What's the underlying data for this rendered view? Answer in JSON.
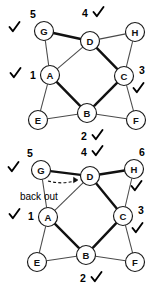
{
  "figure": {
    "colors": {
      "node_fill": "#ffffff",
      "node_stroke": "#1a1a1a",
      "edge_thin": "#4a4a4a",
      "edge_bold": "#111111",
      "text": "#000000"
    }
  },
  "graphs": [
    {
      "id": "graph-top",
      "nodes": [
        {
          "id": "G",
          "label": "G",
          "cx": 44,
          "cy": 31,
          "r": 9.5
        },
        {
          "id": "D",
          "label": "D",
          "cx": 90,
          "cy": 41,
          "r": 9.5
        },
        {
          "id": "H",
          "label": "H",
          "cx": 135,
          "cy": 32,
          "r": 9.5
        },
        {
          "id": "A",
          "label": "A",
          "cx": 50,
          "cy": 75,
          "r": 9.5
        },
        {
          "id": "C",
          "label": "C",
          "cx": 124,
          "cy": 76,
          "r": 9.5
        },
        {
          "id": "E",
          "label": "E",
          "cx": 38,
          "cy": 120,
          "r": 9.5
        },
        {
          "id": "B",
          "label": "B",
          "cx": 87,
          "cy": 113,
          "r": 9.5
        },
        {
          "id": "F",
          "label": "F",
          "cx": 136,
          "cy": 120,
          "r": 9.5
        }
      ],
      "edges": [
        {
          "from": "G",
          "to": "D",
          "style": "bold"
        },
        {
          "from": "D",
          "to": "H",
          "style": "thin"
        },
        {
          "from": "G",
          "to": "A",
          "style": "thin"
        },
        {
          "from": "A",
          "to": "D",
          "style": "thin"
        },
        {
          "from": "D",
          "to": "C",
          "style": "bold"
        },
        {
          "from": "C",
          "to": "H",
          "style": "thin"
        },
        {
          "from": "A",
          "to": "E",
          "style": "thin"
        },
        {
          "from": "A",
          "to": "B",
          "style": "bold"
        },
        {
          "from": "B",
          "to": "C",
          "style": "bold"
        },
        {
          "from": "E",
          "to": "B",
          "style": "thin"
        },
        {
          "from": "B",
          "to": "F",
          "style": "thin"
        },
        {
          "from": "C",
          "to": "F",
          "style": "thin"
        }
      ],
      "order_labels": [
        {
          "text": "5",
          "x": 33,
          "y": 14
        },
        {
          "text": "4",
          "x": 85,
          "y": 13
        },
        {
          "text": "1",
          "x": 33,
          "y": 75
        },
        {
          "text": "3",
          "x": 142,
          "y": 70
        },
        {
          "text": "2",
          "x": 84,
          "y": 136
        }
      ],
      "check_marks": [
        {
          "x": 14,
          "y": 27
        },
        {
          "x": 98,
          "y": 12
        },
        {
          "x": 15,
          "y": 73
        },
        {
          "x": 138,
          "y": 88
        },
        {
          "x": 97,
          "y": 135
        }
      ],
      "annotations": []
    },
    {
      "id": "graph-bottom",
      "nodes": [
        {
          "id": "G",
          "label": "G",
          "cx": 41,
          "cy": 26,
          "r": 9.5
        },
        {
          "id": "D",
          "label": "D",
          "cx": 90,
          "cy": 32,
          "r": 9.5
        },
        {
          "id": "H",
          "label": "H",
          "cx": 134,
          "cy": 25,
          "r": 9.5
        },
        {
          "id": "A",
          "label": "A",
          "cx": 48,
          "cy": 73,
          "r": 9.5
        },
        {
          "id": "C",
          "label": "C",
          "cx": 123,
          "cy": 72,
          "r": 9.5
        },
        {
          "id": "E",
          "label": "E",
          "cx": 37,
          "cy": 118,
          "r": 9.5
        },
        {
          "id": "B",
          "label": "B",
          "cx": 86,
          "cy": 111,
          "r": 9.5
        },
        {
          "id": "F",
          "label": "F",
          "cx": 135,
          "cy": 118,
          "r": 9.5
        }
      ],
      "edges": [
        {
          "from": "G",
          "to": "D",
          "style": "bold"
        },
        {
          "from": "D",
          "to": "H",
          "style": "bold"
        },
        {
          "from": "G",
          "to": "A",
          "style": "thin"
        },
        {
          "from": "A",
          "to": "D",
          "style": "thin"
        },
        {
          "from": "D",
          "to": "C",
          "style": "bold"
        },
        {
          "from": "C",
          "to": "H",
          "style": "thin"
        },
        {
          "from": "A",
          "to": "E",
          "style": "thin"
        },
        {
          "from": "A",
          "to": "B",
          "style": "bold"
        },
        {
          "from": "B",
          "to": "C",
          "style": "bold"
        },
        {
          "from": "E",
          "to": "B",
          "style": "thin"
        },
        {
          "from": "B",
          "to": "F",
          "style": "thin"
        },
        {
          "from": "C",
          "to": "F",
          "style": "thin"
        }
      ],
      "order_labels": [
        {
          "text": "5",
          "x": 30,
          "y": 9
        },
        {
          "text": "4",
          "x": 84,
          "y": 8
        },
        {
          "text": "6",
          "x": 142,
          "y": 8
        },
        {
          "text": "1",
          "x": 31,
          "y": 72
        },
        {
          "text": "3",
          "x": 141,
          "y": 66
        },
        {
          "text": "2",
          "x": 83,
          "y": 134
        }
      ],
      "check_marks": [
        {
          "x": 13,
          "y": 23
        },
        {
          "x": 97,
          "y": 7
        },
        {
          "x": 136,
          "y": 42
        },
        {
          "x": 14,
          "y": 70
        },
        {
          "x": 137,
          "y": 84
        },
        {
          "x": 96,
          "y": 133
        }
      ],
      "annotations": [
        {
          "type": "back-out-arrow",
          "label": "back out",
          "label_x": 20,
          "label_y": 52,
          "arrow_from": {
            "x": 48,
            "y": 37
          },
          "arrow_to": {
            "x": 78,
            "y": 36
          }
        }
      ]
    }
  ]
}
